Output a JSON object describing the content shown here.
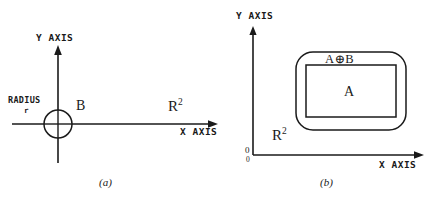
{
  "figure": {
    "background_color": "#ffffff",
    "ink_color": "#1a1a1a",
    "panels": [
      {
        "id": "a",
        "caption": "(a)",
        "y_axis_label": "Y AXIS",
        "x_axis_label": "X AXIS",
        "space_label": "R",
        "space_exponent": "2",
        "radius_label": "RADIUS",
        "radius_symbol": "r",
        "element_label": "B",
        "element_shape": "circle",
        "circle": {
          "cx": 58,
          "cy": 124,
          "r": 14
        }
      },
      {
        "id": "b",
        "caption": "(b)",
        "y_axis_label": "Y AXIS",
        "x_axis_label": "X AXIS",
        "space_label": "R",
        "space_exponent": "2",
        "origin_label": "0",
        "origin_label_secondary": "0",
        "dilation_label": "A⊕B",
        "set_label": "A",
        "outer_shape": "rounded-rectangle",
        "inner_shape": "rectangle",
        "outer_rect": {
          "x": 296,
          "y": 52,
          "width": 110,
          "height": 78,
          "corner_radius": 17
        },
        "inner_rect": {
          "x": 306,
          "y": 65,
          "width": 90,
          "height": 52
        }
      }
    ]
  }
}
